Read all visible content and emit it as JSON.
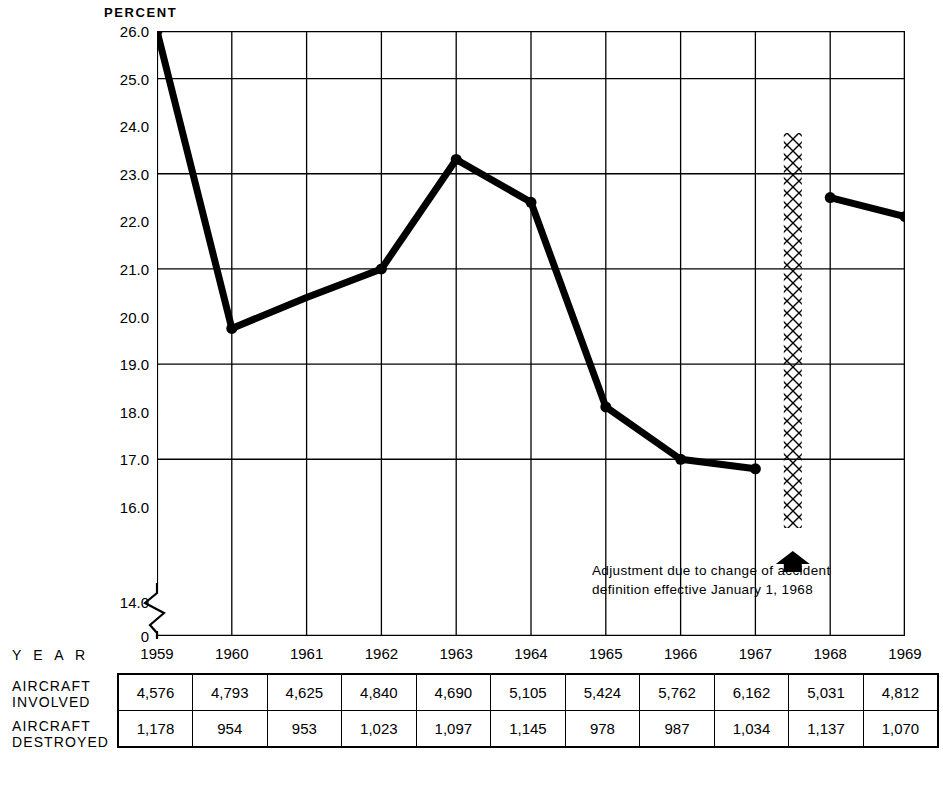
{
  "axis_title": "PERCENT",
  "row_labels": {
    "year": "Y E A R",
    "involved": "AIRCRAFT\nINVOLVED",
    "destroyed": "AIRCRAFT\nDESTROYED"
  },
  "annotation": {
    "line1": "Adjustment due to change of accident",
    "line2": "definition effective January 1, 1968"
  },
  "colors": {
    "line": "#000000",
    "grid": "#000000",
    "frame": "#000000",
    "background": "#ffffff"
  },
  "chart_data": {
    "type": "line",
    "title": "",
    "xlabel": "",
    "ylabel": "PERCENT",
    "ylim": [
      14.0,
      26.0
    ],
    "y_axis_break": true,
    "y_break_label": "0",
    "grid": true,
    "legend": "none",
    "categories": [
      "1959",
      "1960",
      "1961",
      "1962",
      "1963",
      "1964",
      "1965",
      "1966",
      "1967",
      "1968",
      "1969"
    ],
    "ytick_labels": [
      "26.0",
      "25.0",
      "24.0",
      "23.0",
      "22.0",
      "21.0",
      "20.0",
      "19.0",
      "18.0",
      "17.0",
      "16.0",
      "14.0",
      "0"
    ],
    "ytick_values": [
      26.0,
      25.0,
      24.0,
      23.0,
      22.0,
      21.0,
      20.0,
      19.0,
      18.0,
      17.0,
      16.0,
      14.0
    ],
    "gridline_values": [
      25.0,
      23.0,
      21.0,
      19.0,
      17.0
    ],
    "series": [
      {
        "name": "Percent destroyed of aircraft involved",
        "x": [
          "1959",
          "1960",
          "1961",
          "1962",
          "1963",
          "1964",
          "1965",
          "1966",
          "1967"
        ],
        "values": [
          26.0,
          19.75,
          20.4,
          21.0,
          23.3,
          22.4,
          18.1,
          17.0,
          16.8
        ],
        "markers": [
          "1959",
          "1960",
          "1962",
          "1963",
          "1964",
          "1965",
          "1966",
          "1967"
        ]
      },
      {
        "name": "Percent destroyed of aircraft involved (new definition)",
        "x": [
          "1968",
          "1969"
        ],
        "values": [
          22.5,
          22.1
        ],
        "markers": [
          "1968",
          "1969"
        ]
      }
    ],
    "annotations": [
      {
        "type": "hatched-band",
        "position_between": [
          "1967",
          "1968"
        ],
        "text": "Adjustment due to change of accident definition effective January 1, 1968",
        "arrow": "up"
      }
    ],
    "table": {
      "columns": [
        "1959",
        "1960",
        "1961",
        "1962",
        "1963",
        "1964",
        "1965",
        "1966",
        "1967",
        "1968",
        "1969"
      ],
      "rows": [
        {
          "label": "AIRCRAFT INVOLVED",
          "values": [
            "4,576",
            "4,793",
            "4,625",
            "4,840",
            "4,690",
            "5,105",
            "5,424",
            "5,762",
            "6,162",
            "5,031",
            "4,812"
          ]
        },
        {
          "label": "AIRCRAFT DESTROYED",
          "values": [
            "1,178",
            "954",
            "953",
            "1,023",
            "1,097",
            "1,145",
            "978",
            "987",
            "1,034",
            "1,137",
            "1,070"
          ]
        }
      ]
    }
  }
}
